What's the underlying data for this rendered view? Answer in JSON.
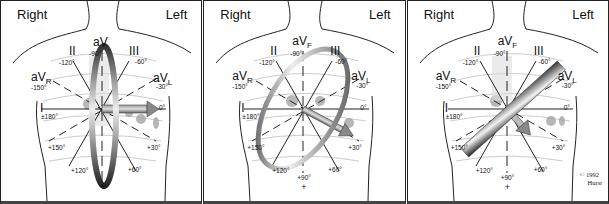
{
  "figure": {
    "panels": [
      {
        "id": "panel-1",
        "side_right": "Right",
        "side_left": "Left",
        "vector_angle_deg": 0,
        "plane": "vertical ring perpendicular to 0° vector"
      },
      {
        "id": "panel-2",
        "side_right": "Right",
        "side_left": "Left",
        "vector_angle_deg": 30,
        "plane": "tilted ring perpendicular to +30° vector"
      },
      {
        "id": "panel-3",
        "side_right": "Right",
        "side_left": "Left",
        "vector_angle_deg": 45,
        "plane": "diagonal bar perpendicular to ~+45° vector",
        "copyright": "© 1992",
        "author": "Hurst"
      }
    ],
    "leads": {
      "I": {
        "name": "I",
        "neg": "±180°",
        "pos": "0°"
      },
      "II": {
        "name": "II",
        "neg": "-120°",
        "pos": "+60°"
      },
      "III": {
        "name": "III",
        "neg": "-60°",
        "pos": "+120°"
      },
      "aVR": {
        "name": "aV",
        "sub": "R",
        "pos": "-150°",
        "neg": "+30°"
      },
      "aVL": {
        "name": "aV",
        "sub": "L",
        "pos": "-30°",
        "neg": "+150°"
      },
      "aVF": {
        "name": "aV",
        "sub": "F",
        "neg": "-90°",
        "pos": "+90°"
      }
    },
    "signs": {
      "plus": "+",
      "minus": "-"
    },
    "colors": {
      "line": "#222222",
      "grey_body": "#bdbdbd",
      "heart": "#8a8a8a"
    }
  }
}
